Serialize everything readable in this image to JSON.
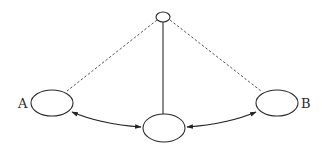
{
  "diagram": {
    "type": "graph",
    "nodes": [
      {
        "id": "top",
        "label": "",
        "shape": "ellipse",
        "cx": 163,
        "cy": 17,
        "rx": 7,
        "ry": 5
      },
      {
        "id": "A",
        "label": "A",
        "shape": "ellipse",
        "cx": 52,
        "cy": 103,
        "rx": 21,
        "ry": 13,
        "label_x": 23,
        "label_y": 108
      },
      {
        "id": "center",
        "label": "",
        "shape": "ellipse",
        "cx": 164,
        "cy": 128,
        "rx": 21,
        "ry": 14
      },
      {
        "id": "B",
        "label": "B",
        "shape": "ellipse",
        "cx": 277,
        "cy": 103,
        "rx": 21,
        "ry": 13,
        "label_x": 300,
        "label_y": 108
      }
    ],
    "edges": [
      {
        "from": "top",
        "to": "A",
        "style": "dashed",
        "directed": false
      },
      {
        "from": "top",
        "to": "B",
        "style": "dashed",
        "directed": false
      },
      {
        "from": "top",
        "to": "center",
        "style": "solid",
        "directed": false
      },
      {
        "from": "A",
        "to": "center",
        "style": "solid",
        "directed": "both",
        "curved": true
      },
      {
        "from": "center",
        "to": "B",
        "style": "solid",
        "directed": "both",
        "curved": true
      }
    ],
    "colors": {
      "stroke": "#2a2a2a",
      "dashed": "#555555",
      "background": "#ffffff"
    }
  }
}
